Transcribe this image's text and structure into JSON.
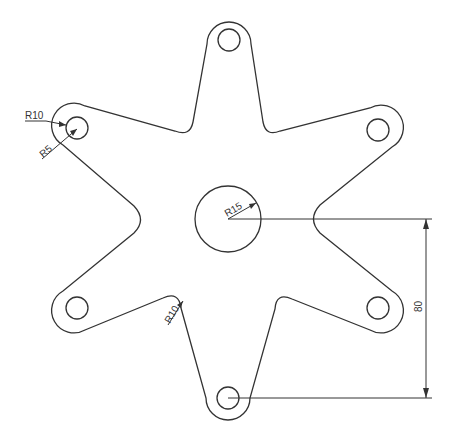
{
  "drawing": {
    "type": "cad-2d-part",
    "description": "Six-lobed star plate with bolt holes and central bore",
    "stroke_color": "#333333",
    "background": "#ffffff"
  },
  "dimensions": {
    "lobe_outer_radius": "R10",
    "lobe_hole_radius": "R5",
    "center_bore_radius": "R15",
    "inner_fillet_radius": "R10",
    "vertical_distance": "80"
  }
}
